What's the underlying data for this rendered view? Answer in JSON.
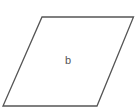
{
  "diagram": {
    "shape": "parallelogram",
    "label": "b",
    "stroke_color": "#555555",
    "fill_color": "#ffffff",
    "vertices": [
      [
        42,
        17
      ],
      [
        134,
        17
      ],
      [
        97,
        106
      ],
      [
        3,
        106
      ]
    ],
    "label_position": [
      68,
      64
    ]
  }
}
